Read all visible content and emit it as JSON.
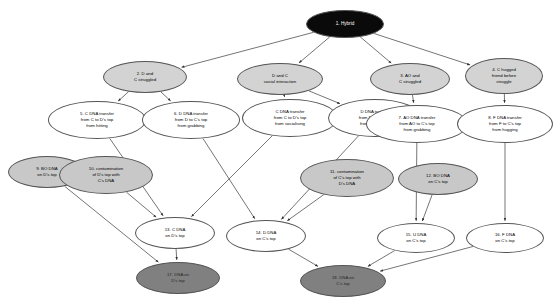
{
  "diagram": {
    "background_color": "#ffffff",
    "edge_color": "#3a3a3a",
    "nodes": [
      {
        "id": "n1",
        "label": "1. Hybrid",
        "cx": 345,
        "cy": 24,
        "rw": 78,
        "rh": 28,
        "fill": "black",
        "font": 4.6
      },
      {
        "id": "n2",
        "label": "2. D and\nC struggled",
        "cx": 145,
        "cy": 77,
        "rw": 84,
        "rh": 32,
        "fill": "light",
        "font": 4.3
      },
      {
        "id": "n3",
        "label": "D and C\nsocial interaction",
        "cx": 280,
        "cy": 79,
        "rw": 86,
        "rh": 32,
        "fill": "light",
        "font": 4.3
      },
      {
        "id": "n4",
        "label": "3. AO and\nC struggled",
        "cx": 410,
        "cy": 79,
        "rw": 80,
        "rh": 32,
        "fill": "light",
        "font": 4.3
      },
      {
        "id": "n5",
        "label": "4. C hugged\nfriend before\nstruggle",
        "cx": 504,
        "cy": 76,
        "rw": 78,
        "rh": 36,
        "fill": "light",
        "font": 4.3
      },
      {
        "id": "n6",
        "label": "5. C DNA transfer\nfrom C to D's top\nfrom hitting",
        "cx": 97,
        "cy": 120,
        "rw": 98,
        "rh": 38,
        "fill": "white",
        "font": 4.3
      },
      {
        "id": "n7",
        "label": "6. D DNA transfer\nfrom D to C's top\nfrom grabbing",
        "cx": 191,
        "cy": 120,
        "rw": 98,
        "rh": 38,
        "fill": "white",
        "font": 4.3
      },
      {
        "id": "n8",
        "label": "C DNA transfer\nfrom C to D's top\nfrom socialising",
        "cx": 290,
        "cy": 118,
        "rw": 96,
        "rh": 38,
        "fill": "white",
        "font": 4.3
      },
      {
        "id": "n9",
        "label": "D DNA transfer\nfrom D to C's top\nfrom socialising",
        "cx": 375,
        "cy": 118,
        "rw": 94,
        "rh": 38,
        "fill": "white",
        "font": 4.3
      },
      {
        "id": "n10",
        "label": "7. AO DNA transfer\nfrom AO to C's top\nfrom grabbing",
        "cx": 417,
        "cy": 124,
        "rw": 102,
        "rh": 38,
        "fill": "white",
        "font": 4.3
      },
      {
        "id": "n11",
        "label": "8. F DNA transfer\nfrom F to C's top\nfrom hugging",
        "cx": 505,
        "cy": 124,
        "rw": 96,
        "rh": 38,
        "fill": "white",
        "font": 4.3
      },
      {
        "id": "n12",
        "label": "9. BO DNA\non D's top",
        "cx": 47,
        "cy": 172,
        "rw": 78,
        "rh": 32,
        "fill": "mid",
        "font": 4.3
      },
      {
        "id": "n13",
        "label": "10. contamination\nof D's top with\nC's DNA",
        "cx": 106,
        "cy": 175,
        "rw": 94,
        "rh": 38,
        "fill": "mid",
        "font": 4.3
      },
      {
        "id": "n14",
        "label": "11. contamination\nof C's top with\nD's DNA",
        "cx": 347,
        "cy": 178,
        "rw": 94,
        "rh": 38,
        "fill": "mid",
        "font": 4.3
      },
      {
        "id": "n15",
        "label": "12. BO DNA\non C's top",
        "cx": 438,
        "cy": 179,
        "rw": 80,
        "rh": 32,
        "fill": "mid",
        "font": 4.3
      },
      {
        "id": "n16",
        "label": "13. C DNA\non D's top",
        "cx": 175,
        "cy": 233,
        "rw": 80,
        "rh": 32,
        "fill": "white",
        "font": 4.3
      },
      {
        "id": "n17",
        "label": "14. D DNA\non C's top",
        "cx": 266,
        "cy": 236,
        "rw": 80,
        "rh": 32,
        "fill": "white",
        "font": 4.3
      },
      {
        "id": "n18",
        "label": "15. U DNA\non C's top",
        "cx": 416,
        "cy": 238,
        "rw": 78,
        "rh": 30,
        "fill": "white",
        "font": 4.3
      },
      {
        "id": "n19",
        "label": "16. F DNA\non C's top",
        "cx": 505,
        "cy": 238,
        "rw": 78,
        "rh": 30,
        "fill": "white",
        "font": 4.3
      },
      {
        "id": "n20",
        "label": "17. DNA on\nD's top",
        "cx": 178,
        "cy": 278,
        "rw": 84,
        "rh": 32,
        "fill": "dark",
        "font": 4.3
      },
      {
        "id": "n21",
        "label": "18. DNA on\nC's top",
        "cx": 343,
        "cy": 281,
        "rw": 86,
        "rh": 32,
        "fill": "dark",
        "font": 4.3
      }
    ],
    "edges": [
      {
        "from": "n1",
        "to": "n2"
      },
      {
        "from": "n1",
        "to": "n3"
      },
      {
        "from": "n1",
        "to": "n4"
      },
      {
        "from": "n1",
        "to": "n5"
      },
      {
        "from": "n2",
        "to": "n6"
      },
      {
        "from": "n2",
        "to": "n7"
      },
      {
        "from": "n3",
        "to": "n8"
      },
      {
        "from": "n3",
        "to": "n9"
      },
      {
        "from": "n4",
        "to": "n10"
      },
      {
        "from": "n5",
        "to": "n11"
      },
      {
        "from": "n6",
        "to": "n16"
      },
      {
        "from": "n7",
        "to": "n17"
      },
      {
        "from": "n8",
        "to": "n16"
      },
      {
        "from": "n9",
        "to": "n17"
      },
      {
        "from": "n10",
        "to": "n18"
      },
      {
        "from": "n11",
        "to": "n19"
      },
      {
        "from": "n13",
        "to": "n16"
      },
      {
        "from": "n14",
        "to": "n17"
      },
      {
        "from": "n15",
        "to": "n18"
      },
      {
        "from": "n12",
        "to": "n20"
      },
      {
        "from": "n16",
        "to": "n20"
      },
      {
        "from": "n17",
        "to": "n21"
      },
      {
        "from": "n18",
        "to": "n21"
      },
      {
        "from": "n19",
        "to": "n21"
      }
    ]
  }
}
